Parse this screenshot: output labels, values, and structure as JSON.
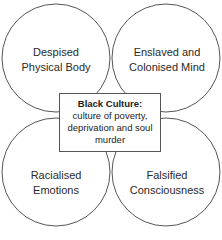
{
  "diagram": {
    "circles": [
      {
        "id": "top-left",
        "label_line1": "Despised",
        "label_line2": "Physical Body"
      },
      {
        "id": "top-right",
        "label_line1": "Enslaved and",
        "label_line2": "Colonised Mind"
      },
      {
        "id": "bottom-left",
        "label_line1": "Racialised",
        "label_line2": "Emotions"
      },
      {
        "id": "bottom-right",
        "label_line1": "Falsified",
        "label_line2": "Consciousness"
      }
    ],
    "center_box": {
      "title": "Black Culture:",
      "line1": "culture of poverty,",
      "line2": "deprivation and soul",
      "line3": "murder"
    },
    "colors": {
      "stroke": "#555555",
      "background": "#ffffff",
      "text": "#2a2a2a"
    }
  }
}
